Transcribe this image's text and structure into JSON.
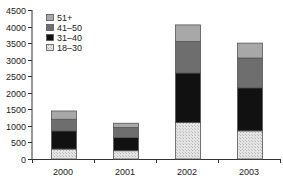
{
  "chart_data": {
    "type": "bar",
    "stacked": true,
    "title": "",
    "xlabel": "",
    "ylabel": "",
    "categories": [
      "2000",
      "2001",
      "2002",
      "2003"
    ],
    "series": [
      {
        "name": "18–30",
        "values": [
          300,
          250,
          1100,
          850
        ],
        "fill": "hatch-light"
      },
      {
        "name": "31–40",
        "values": [
          550,
          400,
          1500,
          1300
        ],
        "fill": "#111111"
      },
      {
        "name": "41–50",
        "values": [
          350,
          300,
          950,
          900
        ],
        "fill": "#6e6e6e"
      },
      {
        "name": "51+",
        "values": [
          250,
          130,
          500,
          450
        ],
        "fill": "#a8a8a8"
      }
    ],
    "totals": [
      1450,
      1080,
      4050,
      3500
    ],
    "ylim": [
      0,
      4500
    ],
    "yticks": [
      0,
      500,
      1000,
      1500,
      2000,
      2500,
      3000,
      3500,
      4000,
      4500
    ],
    "grid": false,
    "legend": {
      "position": "upper-left",
      "entries": [
        "51+",
        "41–50",
        "31–40",
        "18–30"
      ]
    }
  }
}
